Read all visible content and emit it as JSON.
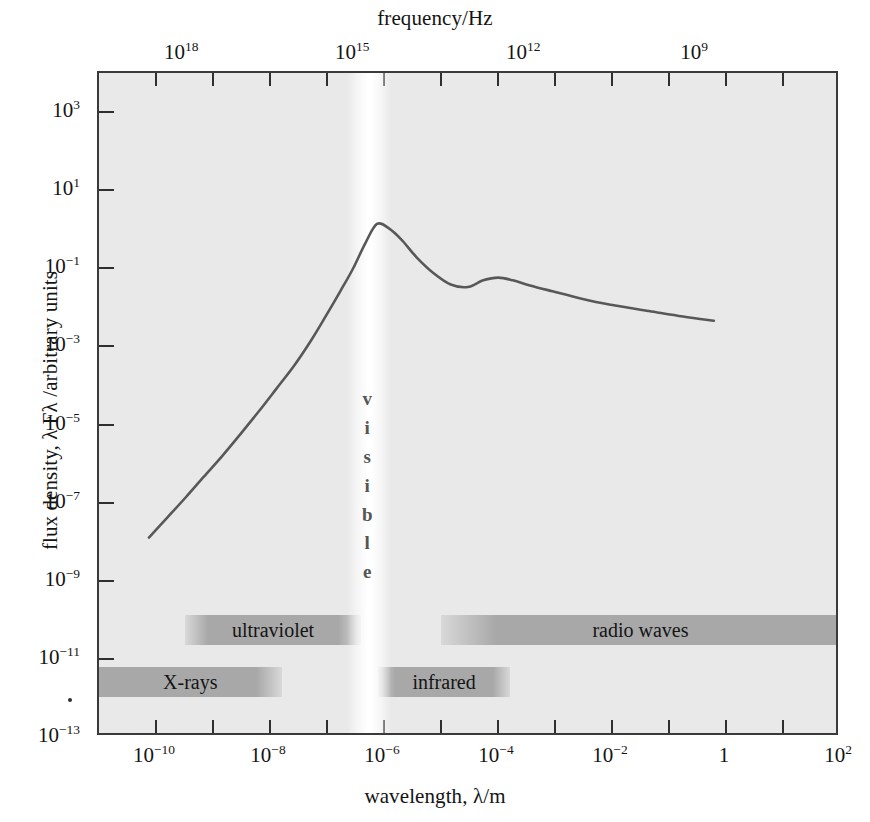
{
  "figure": {
    "top_axis_title": "frequency/Hz",
    "bottom_axis_title": "wavelength, λ/m",
    "y_axis_title": "flux density, λ Fλ /arbitrary units",
    "plot_background_color": "#e9e9e9",
    "frame_color": "#3a3a3a",
    "curve_color": "#585858",
    "band_color": "#a8a8a8",
    "visible_band_color": "#ffffff"
  },
  "visible_band": {
    "name": "visible",
    "letters": [
      "v",
      "i",
      "s",
      "i",
      "b",
      "l",
      "e"
    ]
  },
  "bands": [
    {
      "name": "X-rays",
      "label": "X-rays",
      "x_start_m": 1e-11,
      "x_end_m": 1.6e-08,
      "row": "lower"
    },
    {
      "name": "ultraviolet",
      "label": "ultraviolet",
      "x_start_m": 3.2e-10,
      "x_end_m": 4e-07,
      "row": "upper"
    },
    {
      "name": "infrared",
      "label": "infrared",
      "x_start_m": 8e-07,
      "x_end_m": 0.00016,
      "row": "lower"
    },
    {
      "name": "radio waves",
      "label": "radio waves",
      "x_start_m": 1e-05,
      "x_end_m": 100.0,
      "row": "upper"
    }
  ],
  "chart_data": {
    "type": "line",
    "title": "",
    "xlabel": "wavelength, λ/m",
    "ylabel": "flux density, λ Fλ /arbitrary units",
    "x_scale": "log",
    "y_scale": "log",
    "xlim": [
      1e-11,
      100.0
    ],
    "ylim": [
      1e-13,
      10000.0
    ],
    "grid": false,
    "legend": null,
    "x_tick_labels": [
      "10⁻¹⁰",
      "10⁻⁸",
      "10⁻⁶",
      "10⁻⁴",
      "10⁻²",
      "1",
      "10²"
    ],
    "x_ticks": [
      1e-10,
      1e-08,
      1e-06,
      0.0001,
      0.01,
      1,
      100.0
    ],
    "x_minor_ticks": [
      1e-09,
      1e-07,
      1e-05,
      0.001,
      0.1,
      10
    ],
    "y_tick_labels": [
      "10³",
      "10¹",
      "10⁻¹",
      "10⁻³",
      "10⁻⁵",
      "10⁻⁷",
      "10⁻⁹",
      "10⁻¹¹",
      "10⁻¹³"
    ],
    "y_ticks": [
      1000.0,
      10.0,
      0.1,
      0.001,
      1e-05,
      1e-07,
      1e-09,
      1e-11,
      1e-13
    ],
    "secondary_xaxis": {
      "label": "frequency/Hz",
      "tick_labels": [
        "10¹⁸",
        "10¹⁵",
        "10¹²",
        "10⁹"
      ],
      "ticks_hz": [
        1e+18,
        1000000000000000.0,
        1000000000000.0,
        1000000000.0
      ]
    },
    "series": [
      {
        "name": "spectral energy distribution",
        "x": [
          7.6e-11,
          1.6e-10,
          3.4e-10,
          7e-10,
          1.5e-09,
          3.1e-09,
          6.5e-09,
          1.35e-08,
          2.8e-08,
          5.5e-08,
          1e-07,
          1.8e-07,
          3e-07,
          5e-07,
          8e-07,
          1.3e-06,
          2.2e-06,
          4e-06,
          8e-06,
          1.6e-05,
          3.2e-05,
          6e-05,
          0.00011,
          0.0002,
          0.0004,
          0.001,
          0.003,
          0.01,
          0.05,
          0.2,
          0.7
        ],
        "y": [
          1.1e-08,
          3.6e-08,
          1.2e-07,
          4e-07,
          1.4e-06,
          5e-06,
          1.9e-05,
          7.5e-05,
          0.0003,
          0.0013,
          0.0055,
          0.024,
          0.09,
          0.42,
          1.3,
          1.0,
          0.5,
          0.18,
          0.07,
          0.036,
          0.031,
          0.046,
          0.054,
          0.046,
          0.034,
          0.024,
          0.016,
          0.011,
          0.0075,
          0.0054,
          0.0042
        ]
      }
    ],
    "annotations": [
      {
        "text": "visible",
        "kind": "vertical-band"
      },
      {
        "text": "X-rays",
        "kind": "band"
      },
      {
        "text": "ultraviolet",
        "kind": "band"
      },
      {
        "text": "infrared",
        "kind": "band"
      },
      {
        "text": "radio waves",
        "kind": "band"
      }
    ]
  }
}
